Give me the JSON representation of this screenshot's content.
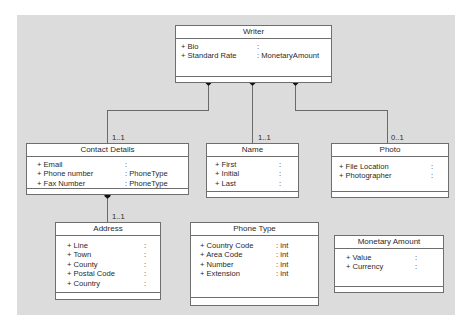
{
  "diagram": {
    "classes": {
      "writer": {
        "name": "Writer",
        "attributes": [
          {
            "name": "+ Bio",
            "type": ":"
          },
          {
            "name": "+ Standard Rate",
            "type": ": MonetaryAmount"
          }
        ]
      },
      "contact_details": {
        "name": "Contact Details",
        "attributes": [
          {
            "name": "+ Email",
            "type": ":"
          },
          {
            "name": "+ Phone number",
            "type": ": PhoneType"
          },
          {
            "name": "+ Fax Number",
            "type": ": PhoneType"
          }
        ]
      },
      "name": {
        "name": "Name",
        "attributes": [
          {
            "name": "+ First",
            "type": ":"
          },
          {
            "name": "+ Initial",
            "type": ":"
          },
          {
            "name": "+ Last",
            "type": ":"
          }
        ]
      },
      "photo": {
        "name": "Photo",
        "attributes": [
          {
            "name": "+ File Location",
            "type": ":"
          },
          {
            "name": "+ Photographer",
            "type": ":"
          }
        ]
      },
      "address": {
        "name": "Address",
        "attributes": [
          {
            "name": "+ Line",
            "type": ":"
          },
          {
            "name": "+ Town",
            "type": ":"
          },
          {
            "name": "+ County",
            "type": ":"
          },
          {
            "name": "+ Postal Code",
            "type": ":"
          },
          {
            "name": "+ Country",
            "type": ":"
          }
        ]
      },
      "phone_type": {
        "name": "Phone Type",
        "attributes": [
          {
            "name": "+ Country Code",
            "type": ": int"
          },
          {
            "name": "+ Area Code",
            "type": ": int"
          },
          {
            "name": "+ Number",
            "type": ": int"
          },
          {
            "name": "+ Extension",
            "type": ": int"
          }
        ]
      },
      "monetary_amount": {
        "name": "Monetary Amount",
        "attributes": [
          {
            "name": "+ Value",
            "type": ":"
          },
          {
            "name": "+ Currency",
            "type": ":"
          }
        ]
      }
    },
    "associations": {
      "writer_contact": {
        "from": "Writer",
        "to": "Contact Details",
        "kind": "composition",
        "multiplicity": "1..1"
      },
      "writer_name": {
        "from": "Writer",
        "to": "Name",
        "kind": "composition",
        "multiplicity": "1..1"
      },
      "writer_photo": {
        "from": "Writer",
        "to": "Photo",
        "kind": "composition",
        "multiplicity": "0..1"
      },
      "contact_address": {
        "from": "Contact Details",
        "to": "Address",
        "kind": "composition",
        "multiplicity": "1..1"
      }
    },
    "colors": {
      "background": "#dcdcdc",
      "box_fill": "#ffffff",
      "box_border": "#6e6e6e",
      "connector": "#6a6a6a",
      "diamond": "#111111"
    }
  }
}
